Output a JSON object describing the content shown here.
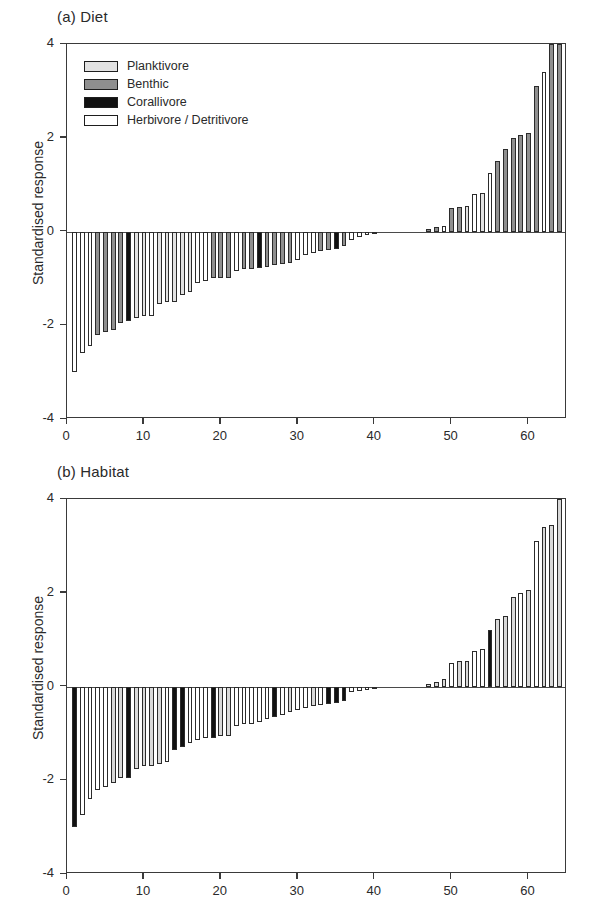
{
  "figure": {
    "panels": [
      {
        "id": "a",
        "title": "(a) Diet",
        "ylabel": "Standardised response",
        "legend": [
          {
            "label": "Planktivore",
            "color": "#e2e2e2"
          },
          {
            "label": "Benthic",
            "color": "#8f8f8f"
          },
          {
            "label": "Corallivore",
            "color": "#111111"
          },
          {
            "label": "Herbivore / Detritivore",
            "color": "#ffffff"
          }
        ]
      },
      {
        "id": "b",
        "title": "(b) Habitat",
        "ylabel": "Standardised response",
        "legend": [
          {
            "label": "Obligate coral",
            "color": "#111111"
          },
          {
            "label": "Facultative coral",
            "color": "#d8d8d8"
          },
          {
            "label": "Non-coral",
            "color": "#ffffff"
          }
        ]
      }
    ]
  },
  "chart_data": [
    {
      "type": "bar",
      "title": "(a) Diet",
      "xlabel": "",
      "ylabel": "Standardised response",
      "xlim": [
        0,
        65
      ],
      "ylim": [
        -4,
        4
      ],
      "yticks": [
        4,
        2,
        0,
        -2,
        -4
      ],
      "ytick_labels": [
        "4",
        "2",
        "0",
        "-2",
        "-4"
      ],
      "xticks": [
        0,
        10,
        20,
        30,
        40,
        50,
        60
      ],
      "xtick_labels": [
        "0",
        "10",
        "20",
        "30",
        "40",
        "50",
        "60"
      ],
      "grid": false,
      "legend_position": "upper-left",
      "categories_note": "Species rank (1-65), sorted ascending by standardised response",
      "group_colors": {
        "Planktivore": "#e2e2e2",
        "Benthic": "#8f8f8f",
        "Corallivore": "#111111",
        "Herbivore / Detritivore": "#ffffff"
      },
      "x": [
        1,
        2,
        3,
        4,
        5,
        6,
        7,
        8,
        9,
        10,
        11,
        12,
        13,
        14,
        15,
        16,
        17,
        18,
        19,
        20,
        21,
        22,
        23,
        24,
        25,
        26,
        27,
        28,
        29,
        30,
        31,
        32,
        33,
        34,
        35,
        36,
        37,
        38,
        39,
        40,
        41,
        42,
        43,
        44,
        45,
        46,
        47,
        48,
        49,
        50,
        51,
        52,
        53,
        54,
        55,
        56,
        57,
        58,
        59,
        60,
        61,
        62,
        63,
        64,
        65
      ],
      "values": [
        -3.0,
        -2.6,
        -2.45,
        -2.2,
        -2.15,
        -2.1,
        -1.95,
        -1.9,
        -1.85,
        -1.8,
        -1.8,
        -1.55,
        -1.5,
        -1.5,
        -1.35,
        -1.3,
        -1.1,
        -1.05,
        -1.0,
        -1.0,
        -1.0,
        -0.85,
        -0.8,
        -0.8,
        -0.78,
        -0.75,
        -0.72,
        -0.7,
        -0.68,
        -0.6,
        -0.5,
        -0.45,
        -0.42,
        -0.4,
        -0.38,
        -0.3,
        -0.18,
        -0.12,
        -0.08,
        -0.03,
        0,
        0,
        0,
        0,
        0,
        0,
        0.06,
        0.1,
        0.12,
        0.5,
        0.52,
        0.55,
        0.8,
        0.82,
        1.25,
        1.5,
        1.75,
        2.0,
        2.05,
        2.1,
        3.1,
        3.4,
        4.0,
        4.0,
        4.0
      ],
      "groups": [
        "Herbivore / Detritivore",
        "Herbivore / Detritivore",
        "Herbivore / Detritivore",
        "Benthic",
        "Benthic",
        "Benthic",
        "Benthic",
        "Corallivore",
        "Planktivore",
        "Planktivore",
        "Herbivore / Detritivore",
        "Planktivore",
        "Planktivore",
        "Planktivore",
        "Planktivore",
        "Planktivore",
        "Herbivore / Detritivore",
        "Herbivore / Detritivore",
        "Benthic",
        "Benthic",
        "Benthic",
        "Herbivore / Detritivore",
        "Benthic",
        "Benthic",
        "Corallivore",
        "Benthic",
        "Benthic",
        "Benthic",
        "Benthic",
        "Herbivore / Detritivore",
        "Herbivore / Detritivore",
        "Herbivore / Detritivore",
        "Benthic",
        "Benthic",
        "Corallivore",
        "Benthic",
        "Herbivore / Detritivore",
        "Herbivore / Detritivore",
        "Herbivore / Detritivore",
        "Benthic",
        "Benthic",
        "Benthic",
        "Benthic",
        "Benthic",
        "Benthic",
        "Benthic",
        "Benthic",
        "Benthic",
        "Herbivore / Detritivore",
        "Benthic",
        "Benthic",
        "Planktivore",
        "Herbivore / Detritivore",
        "Planktivore",
        "Herbivore / Detritivore",
        "Benthic",
        "Benthic",
        "Benthic",
        "Benthic",
        "Benthic",
        "Benthic",
        "Herbivore / Detritivore",
        "Benthic",
        "Benthic",
        "Herbivore / Detritivore"
      ],
      "clipped_bars": [
        63,
        64,
        65
      ],
      "clipped_note": "Three right-most bars extend beyond the y-axis maximum of 4"
    },
    {
      "type": "bar",
      "title": "(b) Habitat",
      "xlabel": "",
      "ylabel": "Standardised response",
      "xlim": [
        0,
        65
      ],
      "ylim": [
        -4,
        4
      ],
      "yticks": [
        4,
        2,
        0,
        -2,
        -4
      ],
      "ytick_labels": [
        "4",
        "2",
        "0",
        "-2",
        "-4"
      ],
      "xticks": [
        0,
        10,
        20,
        30,
        40,
        50,
        60
      ],
      "xtick_labels": [
        "0",
        "10",
        "20",
        "30",
        "40",
        "50",
        "60"
      ],
      "grid": false,
      "legend_position": "upper-left",
      "categories_note": "Species rank (1-65), sorted ascending by standardised response",
      "group_colors": {
        "Obligate coral": "#111111",
        "Facultative coral": "#d8d8d8",
        "Non-coral": "#ffffff"
      },
      "x": [
        1,
        2,
        3,
        4,
        5,
        6,
        7,
        8,
        9,
        10,
        11,
        12,
        13,
        14,
        15,
        16,
        17,
        18,
        19,
        20,
        21,
        22,
        23,
        24,
        25,
        26,
        27,
        28,
        29,
        30,
        31,
        32,
        33,
        34,
        35,
        36,
        37,
        38,
        39,
        40,
        41,
        42,
        43,
        44,
        45,
        46,
        47,
        48,
        49,
        50,
        51,
        52,
        53,
        54,
        55,
        56,
        57,
        58,
        59,
        60,
        61,
        62,
        63,
        64,
        65
      ],
      "values": [
        -3.0,
        -2.75,
        -2.4,
        -2.2,
        -2.15,
        -2.05,
        -1.95,
        -1.95,
        -1.75,
        -1.7,
        -1.7,
        -1.65,
        -1.6,
        -1.35,
        -1.3,
        -1.2,
        -1.15,
        -1.1,
        -1.1,
        -1.05,
        -1.05,
        -0.85,
        -0.8,
        -0.8,
        -0.75,
        -0.7,
        -0.65,
        -0.6,
        -0.55,
        -0.5,
        -0.45,
        -0.42,
        -0.4,
        -0.38,
        -0.35,
        -0.3,
        -0.12,
        -0.1,
        -0.08,
        -0.05,
        0,
        0,
        0,
        0,
        0,
        0,
        0.06,
        0.1,
        0.15,
        0.5,
        0.55,
        0.55,
        0.75,
        0.8,
        1.2,
        1.45,
        1.5,
        1.9,
        2.0,
        2.05,
        3.1,
        3.4,
        3.45,
        4.0,
        4.0
      ],
      "groups": [
        "Obligate coral",
        "Non-coral",
        "Non-coral",
        "Non-coral",
        "Non-coral",
        "Facultative coral",
        "Facultative coral",
        "Obligate coral",
        "Facultative coral",
        "Facultative coral",
        "Facultative coral",
        "Facultative coral",
        "Non-coral",
        "Obligate coral",
        "Obligate coral",
        "Non-coral",
        "Non-coral",
        "Non-coral",
        "Obligate coral",
        "Facultative coral",
        "Facultative coral",
        "Non-coral",
        "Non-coral",
        "Non-coral",
        "Non-coral",
        "Non-coral",
        "Obligate coral",
        "Non-coral",
        "Facultative coral",
        "Non-coral",
        "Non-coral",
        "Facultative coral",
        "Non-coral",
        "Obligate coral",
        "Obligate coral",
        "Obligate coral",
        "Non-coral",
        "Non-coral",
        "Non-coral",
        "Non-coral",
        "Non-coral",
        "Non-coral",
        "Non-coral",
        "Non-coral",
        "Non-coral",
        "Non-coral",
        "Facultative coral",
        "Facultative coral",
        "Facultative coral",
        "Non-coral",
        "Facultative coral",
        "Facultative coral",
        "Non-coral",
        "Non-coral",
        "Obligate coral",
        "Facultative coral",
        "Facultative coral",
        "Facultative coral",
        "Non-coral",
        "Facultative coral",
        "Non-coral",
        "Facultative coral",
        "Facultative coral",
        "Facultative coral",
        "Facultative coral"
      ],
      "clipped_bars": [
        64,
        65
      ],
      "clipped_note": "Two right-most bars extend beyond the y-axis maximum of 4"
    }
  ]
}
